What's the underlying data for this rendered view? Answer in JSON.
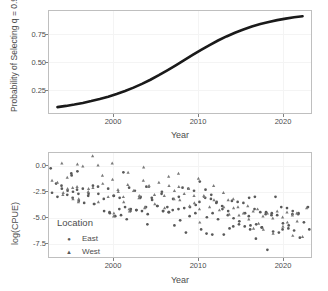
{
  "figure": {
    "background_color": "#ffffff",
    "panel_border_color": "#bfbfbf",
    "text_color": "#4d4d4d",
    "curve_color": "#1a1a1a",
    "point_color_east": "#595959",
    "point_color_west": "#7a7a7a"
  },
  "chart_data": [
    {
      "type": "line",
      "title": "",
      "xlabel": "Year",
      "ylabel": "Probability of Selecting q = 0.9",
      "xlim": [
        1992,
        2023
      ],
      "ylim": [
        0.02,
        0.97
      ],
      "grid": true,
      "legend": null,
      "xticks": [
        2000,
        2010,
        2020
      ],
      "xtick_labels": [
        "2000",
        "2010",
        "2020"
      ],
      "yticks": [
        0.25,
        0.5,
        0.75
      ],
      "ytick_labels": [
        "0.25",
        "0.50",
        "0.75"
      ],
      "series": [
        {
          "name": "Probability of Selecting q = 0.9",
          "x": [
            1993,
            1994,
            1995,
            1996,
            1997,
            1998,
            1999,
            2000,
            2001,
            2002,
            2003,
            2004,
            2005,
            2006,
            2007,
            2008,
            2009,
            2010,
            2011,
            2012,
            2013,
            2014,
            2015,
            2016,
            2017,
            2018,
            2019,
            2020,
            2021,
            2022
          ],
          "values": [
            0.075,
            0.086,
            0.099,
            0.114,
            0.131,
            0.15,
            0.172,
            0.197,
            0.225,
            0.256,
            0.291,
            0.33,
            0.372,
            0.417,
            0.464,
            0.513,
            0.561,
            0.608,
            0.653,
            0.695,
            0.733,
            0.768,
            0.798,
            0.825,
            0.848,
            0.868,
            0.885,
            0.899,
            0.911,
            0.921
          ]
        }
      ]
    },
    {
      "type": "scatter",
      "title": "",
      "xlabel": "Year",
      "ylabel": "log(CPUE)",
      "xlim": [
        1992,
        2023
      ],
      "ylim": [
        -9.3,
        0.9
      ],
      "grid": true,
      "legend": {
        "title": "Location",
        "position": "inside-left",
        "entries": [
          {
            "label": "East",
            "marker": "circle"
          },
          {
            "label": "West",
            "marker": "triangle"
          }
        ]
      },
      "xticks": [
        2000,
        2010,
        2020
      ],
      "xtick_labels": [
        "2000",
        "2010",
        "2020"
      ],
      "yticks": [
        0.0,
        -2.5,
        -5.0,
        -7.5
      ],
      "ytick_labels": [
        "0.0",
        "-2.5",
        "-5.0",
        "-7.5"
      ],
      "series": [
        {
          "name": "East",
          "marker": "circle",
          "points": [
            [
              1993,
              -0.6
            ],
            [
              1993,
              -2.1
            ],
            [
              1993,
              -2.3
            ],
            [
              1993,
              -3.0
            ],
            [
              1993,
              -3.4
            ],
            [
              1994,
              -1.1
            ],
            [
              1994,
              -2.6
            ],
            [
              1994,
              -3.2
            ],
            [
              1994,
              -3.5
            ],
            [
              1995,
              -1.3
            ],
            [
              1995,
              -2.7
            ],
            [
              1995,
              -2.8
            ],
            [
              1995,
              -2.9
            ],
            [
              1995,
              -3.1
            ],
            [
              1996,
              -0.9
            ],
            [
              1996,
              -2.6
            ],
            [
              1996,
              -3.3
            ],
            [
              1996,
              -3.8
            ],
            [
              1996,
              -4.0
            ],
            [
              1997,
              -2.4
            ],
            [
              1997,
              -3.1
            ],
            [
              1997,
              -4.1
            ],
            [
              1998,
              -2.3
            ],
            [
              1998,
              -3.1
            ],
            [
              1998,
              -3.6
            ],
            [
              1998,
              -4.1
            ],
            [
              1999,
              -2.6
            ],
            [
              1999,
              -3.3
            ],
            [
              1999,
              -4.8
            ],
            [
              1999,
              -4.9
            ],
            [
              2000,
              -1.0
            ],
            [
              2000,
              -3.3
            ],
            [
              2000,
              -4.6
            ],
            [
              2000,
              -5.0
            ],
            [
              2000,
              -5.3
            ],
            [
              2001,
              -2.5
            ],
            [
              2001,
              -3.5
            ],
            [
              2001,
              -4.4
            ],
            [
              2001,
              -4.8
            ],
            [
              2001,
              -5.2
            ],
            [
              2002,
              -2.8
            ],
            [
              2002,
              -3.5
            ],
            [
              2002,
              -4.6
            ],
            [
              2002,
              -4.7
            ],
            [
              2002,
              -5.6
            ],
            [
              2003,
              -3.4
            ],
            [
              2003,
              -4.4
            ],
            [
              2003,
              -4.7
            ],
            [
              2003,
              -4.8
            ],
            [
              2003,
              -6.1
            ],
            [
              2004,
              -2.4
            ],
            [
              2004,
              -3.5
            ],
            [
              2004,
              -4.3
            ],
            [
              2004,
              -5.1
            ],
            [
              2005,
              -3.1
            ],
            [
              2005,
              -3.7
            ],
            [
              2005,
              -4.3
            ],
            [
              2005,
              -4.8
            ],
            [
              2006,
              -2.9
            ],
            [
              2006,
              -4.4
            ],
            [
              2006,
              -4.7
            ],
            [
              2006,
              -4.8
            ],
            [
              2006,
              -4.9
            ],
            [
              2007,
              -2.5
            ],
            [
              2007,
              -3.6
            ],
            [
              2007,
              -4.6
            ],
            [
              2007,
              -4.9
            ],
            [
              2007,
              -6.2
            ],
            [
              2008,
              -2.6
            ],
            [
              2008,
              -3.4
            ],
            [
              2008,
              -4.5
            ],
            [
              2008,
              -5.3
            ],
            [
              2008,
              -5.7
            ],
            [
              2009,
              -2.8
            ],
            [
              2009,
              -3.9
            ],
            [
              2009,
              -4.4
            ],
            [
              2009,
              -5.0
            ],
            [
              2009,
              -6.9
            ],
            [
              2010,
              -1.9
            ],
            [
              2010,
              -3.5
            ],
            [
              2010,
              -4.2
            ],
            [
              2010,
              -6.6
            ],
            [
              2010,
              -7.0
            ],
            [
              2011,
              -2.7
            ],
            [
              2011,
              -3.6
            ],
            [
              2011,
              -4.0
            ],
            [
              2011,
              -5.4
            ],
            [
              2011,
              -7.1
            ],
            [
              2012,
              -3.2
            ],
            [
              2012,
              -3.9
            ],
            [
              2012,
              -4.3
            ],
            [
              2012,
              -5.0
            ],
            [
              2012,
              -5.6
            ],
            [
              2013,
              -3.8
            ],
            [
              2013,
              -4.6
            ],
            [
              2013,
              -5.2
            ],
            [
              2013,
              -6.3
            ],
            [
              2013,
              -7.1
            ],
            [
              2014,
              -3.9
            ],
            [
              2014,
              -4.8
            ],
            [
              2014,
              -5.5
            ],
            [
              2014,
              -6.1
            ],
            [
              2014,
              -6.5
            ],
            [
              2015,
              -4.0
            ],
            [
              2015,
              -5.3
            ],
            [
              2015,
              -5.8
            ],
            [
              2015,
              -6.3
            ],
            [
              2015,
              -6.6
            ],
            [
              2016,
              -3.5
            ],
            [
              2016,
              -4.6
            ],
            [
              2016,
              -5.0
            ],
            [
              2016,
              -6.2
            ],
            [
              2016,
              -7.5
            ],
            [
              2017,
              -3.4
            ],
            [
              2017,
              -4.9
            ],
            [
              2017,
              -5.1
            ],
            [
              2017,
              -6.1
            ],
            [
              2017,
              -6.4
            ],
            [
              2018,
              -3.4
            ],
            [
              2018,
              -4.9
            ],
            [
              2018,
              -5.2
            ],
            [
              2018,
              -6.4
            ],
            [
              2018,
              -8.6
            ],
            [
              2019,
              -4.4
            ],
            [
              2019,
              -5.0
            ],
            [
              2019,
              -5.2
            ],
            [
              2019,
              -6.6
            ],
            [
              2019,
              -6.8
            ],
            [
              2020,
              -4.5
            ],
            [
              2020,
              -5.1
            ],
            [
              2020,
              -6.0
            ],
            [
              2020,
              -6.5
            ],
            [
              2020,
              -6.9
            ],
            [
              2021,
              -4.8
            ],
            [
              2021,
              -5.1
            ],
            [
              2021,
              -6.2
            ],
            [
              2021,
              -6.7
            ],
            [
              2022,
              -4.4
            ],
            [
              2022,
              -5.0
            ],
            [
              2022,
              -5.9
            ],
            [
              2022,
              -6.6
            ],
            [
              2022,
              -7.4
            ]
          ]
        },
        {
          "name": "West",
          "marker": "triangle",
          "points": [
            [
              1993,
              -1.8
            ],
            [
              1993,
              -2.0
            ],
            [
              1993,
              -3.2
            ],
            [
              1994,
              -0.1
            ],
            [
              1994,
              -1.5
            ],
            [
              1994,
              -2.5
            ],
            [
              1994,
              -3.0
            ],
            [
              1995,
              -2.4
            ],
            [
              1995,
              -2.6
            ],
            [
              1995,
              -3.6
            ],
            [
              1995,
              -3.9
            ],
            [
              1996,
              -0.2
            ],
            [
              1996,
              -0.4
            ],
            [
              1996,
              -2.9
            ],
            [
              1996,
              -3.6
            ],
            [
              1997,
              0.6
            ],
            [
              1997,
              -0.3
            ],
            [
              1997,
              -2.6
            ],
            [
              1998,
              -1.3
            ],
            [
              1998,
              -2.5
            ],
            [
              1998,
              -3.9
            ],
            [
              1999,
              -0.1
            ],
            [
              1999,
              -2.1
            ],
            [
              1999,
              -3.4
            ],
            [
              1999,
              -5.3
            ],
            [
              2000,
              -1.7
            ],
            [
              2000,
              -2.7
            ],
            [
              2000,
              -3.4
            ],
            [
              2000,
              -5.0
            ],
            [
              2001,
              -2.2
            ],
            [
              2001,
              -2.9
            ],
            [
              2001,
              -3.9
            ],
            [
              2001,
              -4.6
            ],
            [
              2002,
              -1.0
            ],
            [
              2002,
              -2.8
            ],
            [
              2002,
              -3.5
            ],
            [
              2002,
              -4.8
            ],
            [
              2003,
              -1.8
            ],
            [
              2003,
              -2.4
            ],
            [
              2003,
              -3.3
            ],
            [
              2003,
              -4.5
            ],
            [
              2004,
              -0.5
            ],
            [
              2004,
              -2.3
            ],
            [
              2004,
              -3.2
            ],
            [
              2004,
              -4.4
            ],
            [
              2005,
              -2.0
            ],
            [
              2005,
              -3.3
            ],
            [
              2005,
              -4.1
            ],
            [
              2006,
              -1.4
            ],
            [
              2006,
              -3.6
            ],
            [
              2006,
              -4.5
            ],
            [
              2007,
              -1.1
            ],
            [
              2007,
              -2.3
            ],
            [
              2007,
              -2.8
            ],
            [
              2007,
              -3.7
            ],
            [
              2008,
              -2.4
            ],
            [
              2008,
              -3.1
            ],
            [
              2008,
              -4.3
            ],
            [
              2009,
              -2.6
            ],
            [
              2009,
              -3.3
            ],
            [
              2009,
              -4.6
            ],
            [
              2010,
              -1.6
            ],
            [
              2010,
              -3.3
            ],
            [
              2010,
              -4.0
            ],
            [
              2010,
              -5.9
            ],
            [
              2011,
              -2.3
            ],
            [
              2011,
              -3.4
            ],
            [
              2011,
              -4.4
            ],
            [
              2012,
              -3.0
            ],
            [
              2012,
              -3.7
            ],
            [
              2012,
              -4.7
            ],
            [
              2013,
              -3.6
            ],
            [
              2013,
              -4.4
            ],
            [
              2013,
              -5.1
            ],
            [
              2014,
              -3.7
            ],
            [
              2014,
              -4.5
            ],
            [
              2014,
              -5.2
            ],
            [
              2015,
              -4.4
            ],
            [
              2015,
              -5.0
            ],
            [
              2015,
              -5.6
            ],
            [
              2016,
              -4.3
            ],
            [
              2016,
              -4.8
            ],
            [
              2016,
              -6.0
            ],
            [
              2017,
              -4.6
            ],
            [
              2017,
              -5.3
            ],
            [
              2017,
              -6.5
            ],
            [
              2018,
              -5.0
            ],
            [
              2018,
              -5.5
            ],
            [
              2018,
              -6.6
            ],
            [
              2019,
              -4.8
            ],
            [
              2019,
              -5.4
            ],
            [
              2019,
              -7.0
            ],
            [
              2020,
              -4.9
            ],
            [
              2020,
              -5.2
            ],
            [
              2020,
              -6.3
            ],
            [
              2021,
              -5.0
            ],
            [
              2021,
              -5.9
            ],
            [
              2021,
              -7.2
            ],
            [
              2022,
              -4.5
            ],
            [
              2022,
              -5.8
            ],
            [
              2022,
              -7.3
            ]
          ]
        }
      ]
    }
  ]
}
